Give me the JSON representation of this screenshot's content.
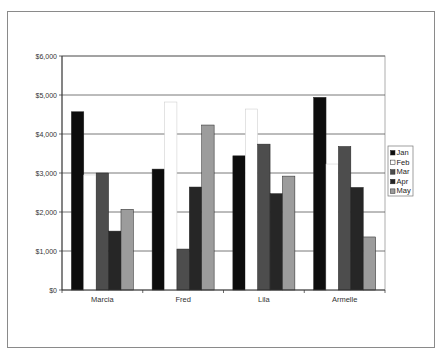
{
  "chart_data": {
    "type": "bar",
    "title": "",
    "xlabel": "",
    "ylabel": "",
    "categories": [
      "Marcia",
      "Fred",
      "Lila",
      "Armelle"
    ],
    "series": [
      {
        "name": "Jan",
        "color": "#0d0d0d",
        "values": [
          4570,
          3100,
          3440,
          4940
        ]
      },
      {
        "name": "Feb",
        "color": "#ffffff",
        "values": [
          2950,
          4820,
          4640,
          3230
        ]
      },
      {
        "name": "Mar",
        "color": "#4d4d4d",
        "values": [
          3000,
          1050,
          3740,
          3680
        ]
      },
      {
        "name": "Apr",
        "color": "#262626",
        "values": [
          1510,
          2640,
          2470,
          2630
        ]
      },
      {
        "name": "May",
        "color": "#9c9c9c",
        "values": [
          2070,
          4230,
          2920,
          1360
        ]
      }
    ],
    "ylim": [
      0,
      6000
    ],
    "yticks": [
      0,
      1000,
      2000,
      3000,
      4000,
      5000,
      6000
    ],
    "ytick_labels": [
      "$0",
      "$1,000",
      "$2,000",
      "$3,000",
      "$4,000",
      "$5,000",
      "$6,000"
    ],
    "grid": true,
    "legend_position": "right"
  }
}
